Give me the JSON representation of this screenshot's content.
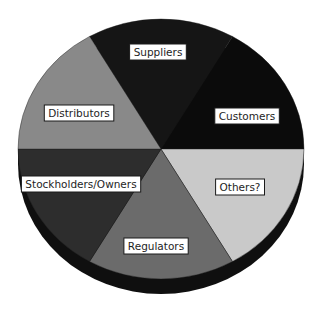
{
  "chart_data": {
    "type": "pie",
    "title": "",
    "style": "3d",
    "slices": [
      {
        "label": "Suppliers",
        "value": 1,
        "color": "#151515"
      },
      {
        "label": "Customers",
        "value": 1,
        "color": "#0b0b0b"
      },
      {
        "label": "Others?",
        "value": 1,
        "color": "#c9c9c9"
      },
      {
        "label": "Regulators",
        "value": 1,
        "color": "#6b6b6b"
      },
      {
        "label": "Stockholders/Owners",
        "value": 1,
        "color": "#2d2d2d"
      },
      {
        "label": "Distributors",
        "value": 1,
        "color": "#898989"
      }
    ],
    "rim_color": "#0f0f0f",
    "legend": "none",
    "labels_placement": "on-slice"
  }
}
